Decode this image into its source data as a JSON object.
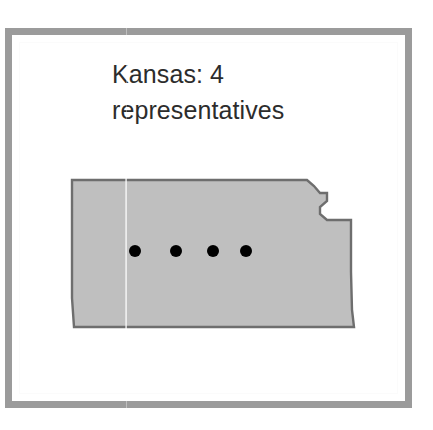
{
  "figure": {
    "caption_line1": "Kansas: 4",
    "caption_line2": "representatives",
    "caption_full": "Kansas: 4 representatives",
    "caption_color": "#2c2c2c"
  },
  "frame": {
    "border_color": "#9b9b9b",
    "background_color": "#ffffff"
  },
  "map": {
    "state_name": "Kansas",
    "fill_color": "#bfbfbf",
    "stroke_color": "#6e6e6e",
    "marker_color": "#000000",
    "marker_count": 4,
    "marker_label": "representative",
    "markers": [
      {
        "name": "representative-dot-1",
        "cx": 77,
        "cy": 83,
        "r": 6
      },
      {
        "name": "representative-dot-2",
        "cx": 118,
        "cy": 83,
        "r": 6
      },
      {
        "name": "representative-dot-3",
        "cx": 155,
        "cy": 83,
        "r": 6
      },
      {
        "name": "representative-dot-4",
        "cx": 188,
        "cy": 83,
        "r": 6
      }
    ],
    "outline_points": "14,10 246,10 253,16 259,22 266,22 266,30 260,36 260,43 266,49 273,49 282,49 290,49 290,57 290,100 291,140 294,158 292,158 14,158 14,100"
  },
  "chart_data": {
    "type": "map",
    "title": "Kansas: 4 representatives",
    "categories": [
      "Kansas"
    ],
    "values": [
      4
    ],
    "unit": "representatives",
    "legend": [],
    "annotations": [
      "4 dots placed inside the Kansas outline, one per representative"
    ]
  }
}
